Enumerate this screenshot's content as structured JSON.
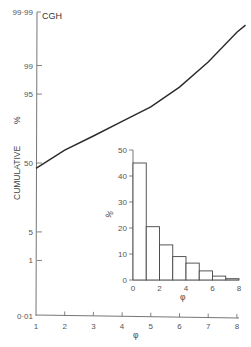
{
  "chart_data": [
    {
      "type": "line",
      "title": "CGH",
      "xlabel": "φ",
      "ylabel": "CUMULATIVE %",
      "y_scale": "probability",
      "xlim": [
        1,
        8
      ],
      "ylim": [
        0.01,
        99.99
      ],
      "x_ticks": [
        1,
        2,
        3,
        4,
        5,
        6,
        7,
        8
      ],
      "y_ticks": [
        "0·01",
        "1",
        "5",
        "50",
        "95",
        "99",
        "99·99"
      ],
      "y_tick_values": [
        0.01,
        1,
        5,
        50,
        95,
        99,
        99.99
      ],
      "grid": false,
      "series": [
        {
          "name": "CGH cumulative",
          "x": [
            1,
            2,
            3,
            4,
            5,
            6,
            7,
            8,
            8.3
          ],
          "y": [
            45,
            62,
            74,
            84,
            91,
            96.5,
            99.2,
            99.91,
            99.95
          ]
        }
      ]
    },
    {
      "type": "bar",
      "title": "",
      "xlabel": "φ",
      "ylabel": "%",
      "xlim": [
        0,
        8
      ],
      "ylim": [
        0,
        50
      ],
      "x_ticks": [
        0,
        2,
        4,
        6,
        8
      ],
      "y_ticks": [
        0,
        10,
        20,
        30,
        40,
        50
      ],
      "grid": false,
      "bin_edges": [
        0,
        1,
        2,
        3,
        4,
        5,
        6,
        7,
        8
      ],
      "categories": [
        "0-1",
        "1-2",
        "2-3",
        "3-4",
        "4-5",
        "5-6",
        "6-7",
        "7-8"
      ],
      "values": [
        45,
        20.5,
        13.5,
        9,
        6.5,
        3.5,
        1.5,
        0.5
      ],
      "position": "inset lower-right"
    }
  ],
  "labels": {
    "main_title": "CGH",
    "main_ylabel": "CUMULATIVE",
    "main_ylabel_unit": "%",
    "main_xlabel": "φ",
    "inset_ylabel": "%",
    "inset_xlabel": "φ"
  },
  "colors": {
    "line": "#2a2a2a",
    "axis": "#555555",
    "background": "#ffffff"
  }
}
